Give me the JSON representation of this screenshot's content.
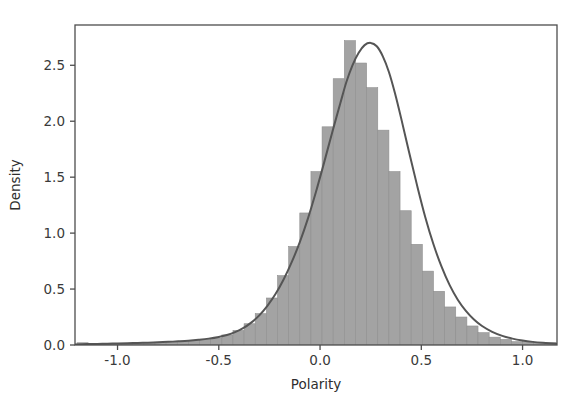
{
  "figure": {
    "background_color": "#ffffff",
    "width": 576,
    "height": 409
  },
  "axes": {
    "frame_color": "#4d4d4d",
    "tick_color": "#4d4d4d",
    "x_axis_title": "Polarity",
    "y_axis_title": "Density",
    "x_tick_labels": [
      "-1.0",
      "-0.5",
      "0.0",
      "0.5",
      "1.0"
    ],
    "y_tick_labels": [
      "0.0",
      "0.5",
      "1.0",
      "1.5",
      "2.0",
      "2.5"
    ]
  },
  "style": {
    "hist_fill_color": "#a3a3a3",
    "hist_edge_color": "#8f8f8f",
    "kde_line_color": "#555555",
    "kde_line_width": 2.0
  },
  "chart_data": {
    "type": "histogram",
    "title": "",
    "xlabel": "Polarity",
    "ylabel": "Density",
    "xlim": [
      -1.21,
      1.17
    ],
    "ylim": [
      0.0,
      2.86
    ],
    "xticks": [
      -1.0,
      -0.5,
      0.0,
      0.5,
      1.0
    ],
    "yticks": [
      0.0,
      0.5,
      1.0,
      1.5,
      2.0,
      2.5
    ],
    "grid": false,
    "legend": false,
    "bin_width": 0.055,
    "bin_edges": [
      -1.2,
      -1.145,
      -1.09,
      -1.035,
      -0.98,
      -0.925,
      -0.87,
      -0.815,
      -0.76,
      -0.705,
      -0.65,
      -0.595,
      -0.54,
      -0.485,
      -0.43,
      -0.375,
      -0.32,
      -0.265,
      -0.21,
      -0.155,
      -0.1,
      -0.045,
      0.01,
      0.065,
      0.12,
      0.175,
      0.23,
      0.285,
      0.34,
      0.395,
      0.45,
      0.505,
      0.56,
      0.615,
      0.67,
      0.725,
      0.78,
      0.835,
      0.89,
      0.945,
      1.0,
      1.055,
      1.11,
      1.165
    ],
    "bin_heights": [
      0.02,
      0.01,
      0.01,
      0.01,
      0.01,
      0.02,
      0.02,
      0.02,
      0.03,
      0.03,
      0.04,
      0.05,
      0.06,
      0.09,
      0.13,
      0.19,
      0.28,
      0.42,
      0.62,
      0.88,
      1.18,
      1.55,
      1.95,
      2.38,
      2.72,
      2.52,
      2.3,
      1.92,
      1.55,
      1.2,
      0.9,
      0.66,
      0.48,
      0.34,
      0.25,
      0.17,
      0.11,
      0.07,
      0.05,
      0.03,
      0.03,
      0.02,
      0.02
    ],
    "kde_curve": {
      "x": [
        -1.21,
        -1.15,
        -1.1,
        -1.05,
        -1.0,
        -0.95,
        -0.9,
        -0.85,
        -0.8,
        -0.75,
        -0.7,
        -0.65,
        -0.6,
        -0.55,
        -0.5,
        -0.46,
        -0.42,
        -0.38,
        -0.34,
        -0.3,
        -0.26,
        -0.22,
        -0.18,
        -0.14,
        -0.1,
        -0.06,
        -0.02,
        0.02,
        0.06,
        0.1,
        0.13,
        0.16,
        0.19,
        0.22,
        0.25,
        0.28,
        0.31,
        0.34,
        0.37,
        0.4,
        0.44,
        0.48,
        0.52,
        0.56,
        0.6,
        0.64,
        0.68,
        0.72,
        0.76,
        0.8,
        0.85,
        0.9,
        0.95,
        1.0,
        1.05,
        1.1,
        1.17
      ],
      "y": [
        0.005,
        0.008,
        0.01,
        0.012,
        0.014,
        0.016,
        0.018,
        0.021,
        0.024,
        0.028,
        0.033,
        0.039,
        0.047,
        0.057,
        0.072,
        0.09,
        0.115,
        0.15,
        0.2,
        0.265,
        0.35,
        0.455,
        0.585,
        0.74,
        0.92,
        1.13,
        1.37,
        1.63,
        1.9,
        2.16,
        2.35,
        2.5,
        2.61,
        2.68,
        2.7,
        2.67,
        2.58,
        2.44,
        2.25,
        2.03,
        1.72,
        1.42,
        1.14,
        0.9,
        0.7,
        0.535,
        0.405,
        0.305,
        0.228,
        0.17,
        0.118,
        0.082,
        0.057,
        0.04,
        0.028,
        0.02,
        0.012
      ]
    },
    "peak": {
      "polarity": 0.25,
      "density": 2.7
    }
  },
  "geometry": {
    "plot_left": 75,
    "plot_right": 557,
    "plot_top": 25,
    "plot_bottom": 345
  }
}
